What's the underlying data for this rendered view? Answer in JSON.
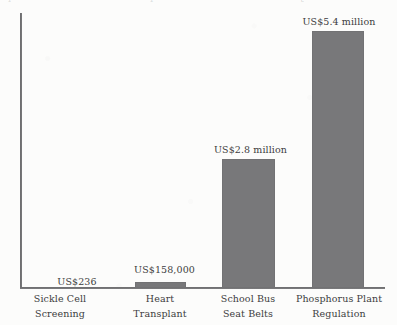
{
  "figure": {
    "background_color": "#fcfcfb",
    "bar_color": "#78787a",
    "axis_color": "#5c5c5e",
    "text_color": "#3d3d40"
  },
  "scan_artifacts": {
    "top_line_fragment_1": "l",
    "top_line_fragment_2": "i",
    "top_line_fragment_3": "t"
  },
  "chart_data": {
    "type": "bar",
    "title": "",
    "subtitle": "",
    "xlabel": "",
    "ylabel": "",
    "grid": false,
    "legend": null,
    "categories": [
      "Sickle Cell\nScreening",
      "Heart\nTransplant",
      "School Bus\nSeat Belts",
      "Phosphorus Plant\nRegulation"
    ],
    "value_labels": [
      "US$236",
      "US$158,000",
      "US$2.8 million",
      "US$5.4 million"
    ],
    "values": [
      236,
      158000,
      2800000,
      5400000
    ],
    "units": "US dollars per life saved",
    "ylim": [
      0,
      5700000
    ],
    "bars": [
      {
        "label": "Sickle Cell\nScreening",
        "value_label": "US$236",
        "value": 236,
        "left": 34,
        "width": 52,
        "height": 0,
        "label_left": 31,
        "label_top": 276
      },
      {
        "label": "Heart\nTransplant",
        "value_label": "US$158,000",
        "value": 158000,
        "left": 135,
        "width": 51,
        "height": 6,
        "label_left": 119,
        "label_top": 264
      },
      {
        "label": "School Bus\nSeat Belts",
        "value_label": "US$2.8 million",
        "value": 2800000,
        "left": 222,
        "width": 53,
        "height": 129,
        "label_left": 204,
        "label_top": 144
      },
      {
        "label": "Phosphorus Plant\nRegulation",
        "value_label": "US$5.4 million",
        "value": 5400000,
        "left": 312,
        "width": 52,
        "height": 257,
        "label_left": 293,
        "label_top": 16
      }
    ],
    "category_label_boxes": [
      {
        "left": 12,
        "width": 96
      },
      {
        "left": 112,
        "width": 96
      },
      {
        "left": 200,
        "width": 96
      },
      {
        "left": 288,
        "width": 102
      }
    ]
  }
}
